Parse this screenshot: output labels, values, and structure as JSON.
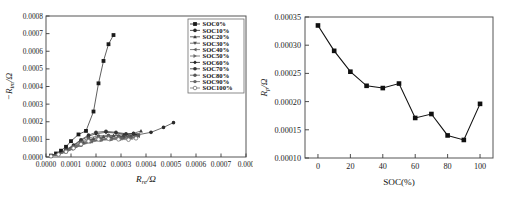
{
  "figure": {
    "background_color": "#ffffff",
    "panels": [
      "nyquist-plot",
      "rp-vs-soc-plot"
    ]
  },
  "chart_data": [
    {
      "type": "scatter",
      "title": "",
      "xlabel": "R_re/Ω",
      "xlabel_parts": {
        "main": "R",
        "sub": "re",
        "unit": "/Ω"
      },
      "ylabel": "−R_im/Ω",
      "ylabel_parts": {
        "prefix": "−",
        "main": "R",
        "sub": "im",
        "unit": "/Ω"
      },
      "xlim": [
        0.0,
        0.0008
      ],
      "ylim": [
        0.0,
        0.0008
      ],
      "xticks": [
        0.0,
        0.0001,
        0.0002,
        0.0003,
        0.0004,
        0.0005,
        0.0006,
        0.0007,
        0.0008
      ],
      "xticklabels": [
        "0.0000",
        "0.0001",
        "0.0002",
        "0.0003",
        "0.0004",
        "0.0005",
        "0.0006",
        "0.0007",
        "0.000"
      ],
      "yticks": [
        0.0,
        0.0001,
        0.0002,
        0.0003,
        0.0004,
        0.0005,
        0.0006,
        0.0007,
        0.0008
      ],
      "yticklabels": [
        "0.0000",
        "0.0001",
        "0.0002",
        "0.0003",
        "0.0004",
        "0.0005",
        "0.0006",
        "0.0007",
        "0.0008"
      ],
      "grid": false,
      "legend_position": "upper right",
      "legend_entries": [
        "SOC0%",
        "SOC10%",
        "SOC20%",
        "SOC30%",
        "SOC40%",
        "SOC50%",
        "SOC60%",
        "SOC70%",
        "SOC80%",
        "SOC90%",
        "SOC100%"
      ],
      "series": [
        {
          "name": "SOC0%",
          "marker": "square",
          "color": "#1a1a1a",
          "x": [
            2e-05,
            4e-05,
            6e-05,
            8e-05,
            0.0001,
            0.00013,
            0.00016,
            0.00019,
            0.00021,
            0.00023,
            0.00025,
            0.00027
          ],
          "y": [
            8e-06,
            2e-05,
            3.6e-05,
            5.8e-05,
            9e-05,
            0.000128,
            0.000148,
            0.000258,
            0.000418,
            0.000545,
            0.00064,
            0.000692
          ]
        },
        {
          "name": "SOC10%",
          "marker": "circle",
          "color": "#2b2b2b",
          "x": [
            2e-05,
            5e-05,
            8e-05,
            0.00011,
            0.00014,
            0.00018,
            0.00022,
            0.00026,
            0.00031,
            0.00036,
            0.00042,
            0.00047,
            0.00051
          ],
          "y": [
            6e-06,
            1.6e-05,
            3e-05,
            4.8e-05,
            6.8e-05,
            8.8e-05,
            9.8e-05,
            0.000104,
            0.000112,
            0.000124,
            0.00014,
            0.000168,
            0.000195
          ]
        },
        {
          "name": "SOC20%",
          "marker": "triangle-up",
          "color": "#3d3d3d",
          "x": [
            2e-05,
            5e-05,
            8e-05,
            0.00011,
            0.00015,
            0.00019,
            0.00023,
            0.00027,
            0.00031,
            0.00035,
            0.00038
          ],
          "y": [
            6e-06,
            1.8e-05,
            3.6e-05,
            5.8e-05,
            8.2e-05,
            0.000104,
            0.000116,
            0.000122,
            0.000126,
            0.000134,
            0.000148
          ]
        },
        {
          "name": "SOC30%",
          "marker": "triangle-down",
          "color": "#4e4e4e",
          "x": [
            2e-05,
            5e-05,
            8e-05,
            0.00011,
            0.00014,
            0.00018,
            0.00022,
            0.00026,
            0.0003,
            0.00034,
            0.00037
          ],
          "y": [
            5e-06,
            1.6e-05,
            3.2e-05,
            5.2e-05,
            7.4e-05,
            9.2e-05,
            0.000102,
            0.000108,
            0.00011,
            0.000116,
            0.000126
          ]
        },
        {
          "name": "SOC40%",
          "marker": "triangle-left",
          "color": "#5c5c5c",
          "x": [
            2e-05,
            5e-05,
            8e-05,
            0.00011,
            0.00014,
            0.00018,
            0.00022,
            0.00026,
            0.0003,
            0.00034,
            0.00037
          ],
          "y": [
            5e-06,
            1.5e-05,
            3e-05,
            5e-05,
            7e-05,
            8.8e-05,
            9.8e-05,
            0.000102,
            0.000104,
            0.000108,
            0.000118
          ]
        },
        {
          "name": "SOC50%",
          "marker": "triangle-right",
          "color": "#6a6a6a",
          "x": [
            2e-05,
            5e-05,
            8e-05,
            0.00011,
            0.00014,
            0.00018,
            0.00022,
            0.00026,
            0.0003,
            0.00033,
            0.00036
          ],
          "y": [
            4e-06,
            1.4e-05,
            2.8e-05,
            4.6e-05,
            6.6e-05,
            8.4e-05,
            9.4e-05,
            9.8e-05,
            0.0001,
            0.000104,
            0.000112
          ]
        },
        {
          "name": "SOC60%",
          "marker": "diamond",
          "color": "#242424",
          "x": [
            2e-05,
            5e-05,
            8e-05,
            0.00011,
            0.00014,
            0.00017,
            0.0002,
            0.00024,
            0.00028,
            0.00032,
            0.00035
          ],
          "y": [
            6e-06,
            1.8e-05,
            3.8e-05,
            6.4e-05,
            9.4e-05,
            0.000118,
            0.000132,
            0.00014,
            0.000136,
            0.000128,
            0.00013
          ]
        },
        {
          "name": "SOC70%",
          "marker": "hexagon",
          "color": "#343434",
          "x": [
            2e-05,
            5e-05,
            8e-05,
            0.00011,
            0.00014,
            0.00017,
            0.0002,
            0.00024,
            0.00028,
            0.00032,
            0.00035
          ],
          "y": [
            6e-06,
            2e-05,
            4.2e-05,
            6.8e-05,
            9.8e-05,
            0.000124,
            0.00014,
            0.000146,
            0.00014,
            0.000132,
            0.000134
          ]
        },
        {
          "name": "SOC80%",
          "marker": "pentagon",
          "color": "#565656",
          "x": [
            2e-05,
            5e-05,
            8e-05,
            0.00011,
            0.00014,
            0.00017,
            0.00021,
            0.00025,
            0.00029,
            0.00033,
            0.00037
          ],
          "y": [
            5e-06,
            1.7e-05,
            3.6e-05,
            6e-05,
            8.6e-05,
            0.000108,
            0.00012,
            0.000124,
            0.00012,
            0.000116,
            0.000122
          ]
        },
        {
          "name": "SOC90%",
          "marker": "star",
          "color": "#646464",
          "x": [
            2e-05,
            5e-05,
            8e-05,
            0.00011,
            0.00014,
            0.00017,
            0.00021,
            0.00025,
            0.00029,
            0.00033,
            0.00036
          ],
          "y": [
            5e-06,
            1.6e-05,
            3.4e-05,
            5.6e-05,
            8e-05,
            0.0001,
            0.000112,
            0.000116,
            0.000112,
            0.000108,
            0.000114
          ]
        },
        {
          "name": "SOC100%",
          "marker": "circle-open",
          "color": "#727272",
          "x": [
            2e-05,
            5e-05,
            8e-05,
            0.00011,
            0.00014,
            0.00017,
            0.00021,
            0.00025,
            0.00029,
            0.00033,
            0.00036
          ],
          "y": [
            4e-06,
            1.4e-05,
            3e-05,
            5e-05,
            7.2e-05,
            9e-05,
            0.0001,
            0.000104,
            0.0001,
            9.8e-05,
            0.000106
          ]
        }
      ]
    },
    {
      "type": "line",
      "title": "",
      "xlabel": "SOC(%)",
      "ylabel": "R_p/Ω",
      "ylabel_parts": {
        "main": "R",
        "sub": "p",
        "unit": "/Ω"
      },
      "x": [
        0,
        10,
        20,
        30,
        40,
        50,
        60,
        70,
        80,
        90,
        100
      ],
      "values": [
        0.000335,
        0.00029,
        0.000253,
        0.000228,
        0.000224,
        0.000232,
        0.000171,
        0.000178,
        0.00014,
        0.000132,
        0.000196
      ],
      "xlim": [
        -8,
        108
      ],
      "ylim": [
        0.0001,
        0.00035
      ],
      "xticks": [
        0,
        20,
        40,
        60,
        80,
        100
      ],
      "xticklabels": [
        "0",
        "20",
        "40",
        "60",
        "80",
        "100"
      ],
      "yticks": [
        0.0001,
        0.00015,
        0.0002,
        0.00025,
        0.0003,
        0.00035
      ],
      "yticklabels": [
        "0.00010",
        "0.00015",
        "0.00020",
        "0.00025",
        "0.00030",
        "0.00035"
      ],
      "grid": false,
      "marker": "square",
      "line_color": "#101010",
      "marker_color": "#101010"
    }
  ]
}
